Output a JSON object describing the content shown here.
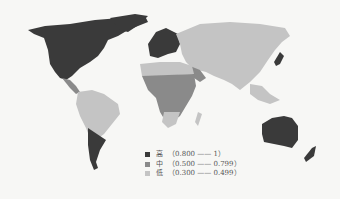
{
  "map": {
    "type": "choropleth-world-map",
    "colors": {
      "high": "#3a3a3a",
      "medium": "#8a8a8a",
      "low": "#c4c4c4",
      "background": "#f7f7f5"
    }
  },
  "legend": {
    "items": [
      {
        "label": "高",
        "range": "（0.800 —— 1）",
        "color": "#3a3a3a"
      },
      {
        "label": "中",
        "range": "（0.500 —— 0.799）",
        "color": "#8a8a8a"
      },
      {
        "label": "低",
        "range": "（0.300 —— 0.499）",
        "color": "#c4c4c4"
      }
    ]
  }
}
